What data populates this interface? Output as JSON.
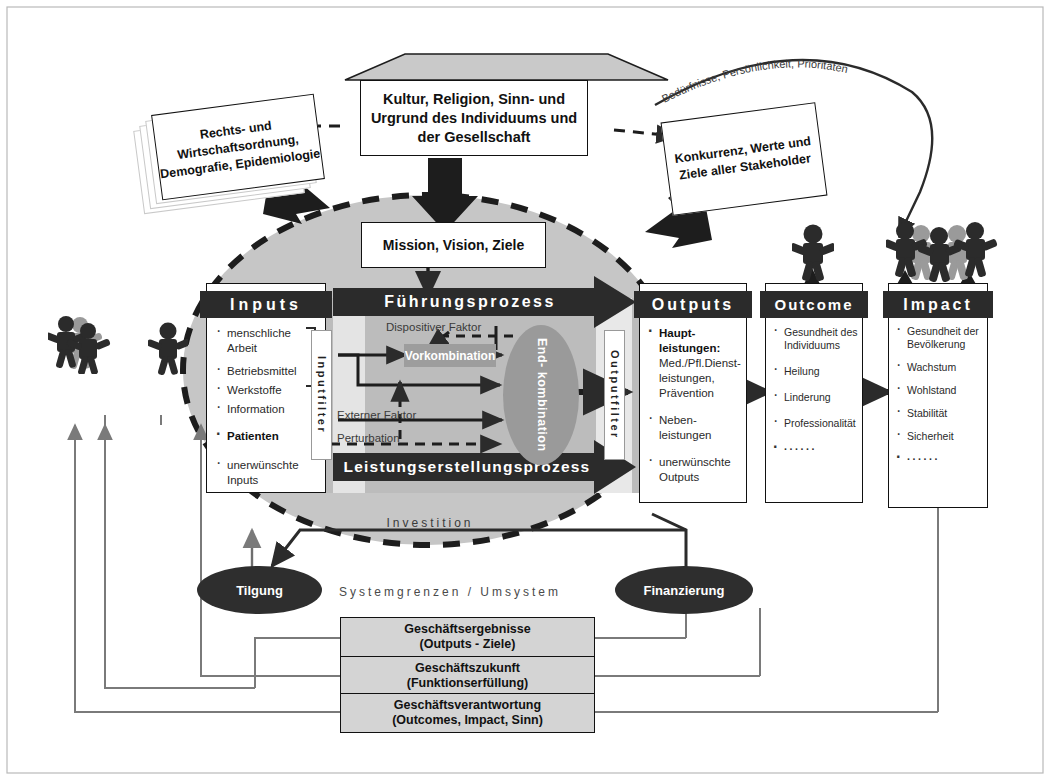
{
  "diagram": {
    "roof": {
      "label": "Kultur, Religion, Sinn- und\nUrgrund des Individuums und\nder Gesellschaft"
    },
    "left_card": {
      "label": "Rechts- und\nWirtschaftsordnung,\nDemografie,\nEpidemiologie"
    },
    "right_card": {
      "label": "Konkurrenz, Werte\nund Ziele aller\nStakeholder"
    },
    "curve_label": "Bedürfnisse, Persönlichkeit, Prioritäten",
    "mission_box": "Mission, Vision, Ziele",
    "columns": [
      {
        "key": "inputs",
        "header": "Inputs",
        "items": [
          {
            "text": "menschliche\nArbeit",
            "bold": false
          },
          {
            "text": "Betriebsmittel",
            "bold": false
          },
          {
            "text": "Werkstoffe",
            "bold": false
          },
          {
            "text": "Information",
            "bold": false
          },
          {
            "text": "Patienten",
            "bold": true
          },
          {
            "text": "unerwünschte\nInputs",
            "bold": false
          }
        ]
      },
      {
        "key": "outputs",
        "header": "Outputs",
        "items": [
          {
            "text": "Haupt-\nleistungen:",
            "bold": true
          },
          {
            "text": "Med./Pfl.Dienst-\nleistungen,\nPrävention",
            "bold": false
          },
          {
            "text": "Neben-\nleistungen",
            "bold": false
          },
          {
            "text": "unerwünschte\nOutputs",
            "bold": false
          }
        ]
      },
      {
        "key": "outcome",
        "header": "Outcome",
        "items": [
          {
            "text": "Gesundheit des\nIndividuums",
            "bold": false
          },
          {
            "text": "Heilung",
            "bold": false
          },
          {
            "text": "Linderung",
            "bold": false
          },
          {
            "text": "Professionalität",
            "bold": false
          },
          {
            "text": "······",
            "bold": false
          }
        ]
      },
      {
        "key": "impact",
        "header": "Impact",
        "items": [
          {
            "text": "Gesundheit der\nBevölkerung",
            "bold": false
          },
          {
            "text": "Wachstum",
            "bold": false
          },
          {
            "text": "Wohlstand",
            "bold": false
          },
          {
            "text": "Stabilität",
            "bold": false
          },
          {
            "text": "Sicherheit",
            "bold": false
          },
          {
            "text": "······",
            "bold": false
          }
        ]
      }
    ],
    "process": {
      "fuehrungsprozess": "Führungsprozess",
      "leistungserstellungsprozess": "Leistungserstellungsprozess",
      "dispositiver_faktor": "Dispositiver Faktor",
      "vorkombination": "Vorkombination",
      "endkombination": "End-\nkombination",
      "externer_faktor": "Externer Faktor",
      "perturbation": "Perturbation",
      "inputfilter": "Inputfilter",
      "outputfilter": "Outputfilter"
    },
    "system": {
      "investition": "Investition",
      "systemgrenzen": "Systemgrenzen / Umsystem",
      "tilgung": "Tilgung",
      "finanzierung": "Finanzierung"
    },
    "bottom_boxes": [
      {
        "line1": "Geschäftsergebnisse",
        "line2": "(Outputs - Ziele)"
      },
      {
        "line1": "Geschäftszukunft",
        "line2": "(Funktionserfüllung)"
      },
      {
        "line1": "Geschäftsverantwortung",
        "line2": "(Outcomes, Impact, Sinn)"
      }
    ],
    "colors": {
      "header_bar": "#2b2b2b",
      "system_circle": "#c6c6c6",
      "process_band": "#bdbdbd",
      "accent_dark": "#2e2e2e",
      "bottom_box": "#d4d4d4",
      "vorkombination": "#9d9d9d",
      "endkombination": "#9a9a9a"
    }
  }
}
